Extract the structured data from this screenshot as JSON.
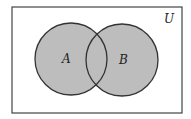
{
  "diagram": {
    "type": "venn",
    "universe": {
      "label": "U",
      "x": 12,
      "y": 7,
      "width": 170,
      "height": 106
    },
    "sets": [
      {
        "label": "A",
        "cx": 71,
        "cy": 59,
        "r": 36
      },
      {
        "label": "B",
        "cx": 122,
        "cy": 60,
        "r": 36
      }
    ],
    "shaded": "A ∪ B",
    "colors": {
      "fill": "#bdbdbd",
      "stroke": "#333333",
      "background": "#ffffff"
    }
  }
}
